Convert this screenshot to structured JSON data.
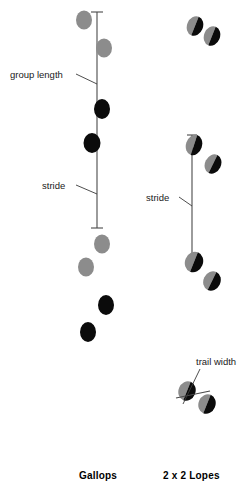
{
  "figure": {
    "width": 250,
    "height": 498,
    "background": "#ffffff"
  },
  "colors": {
    "gray_pad": "#8c8c8c",
    "black_pad": "#0b0b0b",
    "line": "#4a4a4a",
    "leader": "#3a3a3a",
    "label_text": "#1a1a1a",
    "caption_text": "#000000",
    "background": "#ffffff"
  },
  "annotations": [
    {
      "id": "group-length",
      "label": "group length",
      "text_x": 10,
      "text_y": 78,
      "leader": "M76,74 L97,84"
    },
    {
      "id": "stride-left",
      "label": "stride",
      "text_x": 42,
      "text_y": 189,
      "leader": "M76,185 L97,194"
    },
    {
      "id": "stride-right",
      "label": "stride",
      "text_x": 146,
      "text_y": 201,
      "leader": "M179,197 L192,206"
    },
    {
      "id": "trail-width",
      "label": "trail width",
      "text_x": 196,
      "text_y": 365,
      "leader": "M200,369 L183,404"
    }
  ],
  "measures": {
    "left_vertical": {
      "x": 97,
      "y_top": 12,
      "y_bottom": 228,
      "tick_half_width": 6
    },
    "right_vertical": {
      "x": 192,
      "y_top": 135,
      "y_bottom": 254,
      "tick_half_width": 5
    },
    "trail_width_bar": {
      "x1": 176,
      "y1": 398,
      "x2": 210,
      "y2": 391
    }
  },
  "panels": [
    {
      "id": "gallops",
      "caption": "Gallops",
      "caption_x": 79,
      "caption_y": 479,
      "tracks": [
        {
          "cx": 84,
          "cy": 20,
          "rx": 8,
          "ry": 9.5,
          "rotate": 0,
          "fill": "gray"
        },
        {
          "cx": 104,
          "cy": 48,
          "rx": 8,
          "ry": 9.5,
          "rotate": 0,
          "fill": "gray"
        },
        {
          "cx": 102,
          "cy": 109,
          "rx": 8,
          "ry": 10,
          "rotate": 0,
          "fill": "black"
        },
        {
          "cx": 92,
          "cy": 143,
          "rx": 8.5,
          "ry": 10,
          "rotate": 0,
          "fill": "black"
        },
        {
          "cx": 102,
          "cy": 244,
          "rx": 8,
          "ry": 9.5,
          "rotate": 0,
          "fill": "gray"
        },
        {
          "cx": 86,
          "cy": 267,
          "rx": 8,
          "ry": 9.5,
          "rotate": 0,
          "fill": "gray"
        },
        {
          "cx": 106,
          "cy": 305,
          "rx": 8,
          "ry": 10,
          "rotate": 0,
          "fill": "black"
        },
        {
          "cx": 88,
          "cy": 332,
          "rx": 8,
          "ry": 10,
          "rotate": 0,
          "fill": "black"
        }
      ]
    },
    {
      "id": "two-by-two-lopes",
      "caption": "2 x 2 Lopes",
      "caption_x": 163,
      "caption_y": 479,
      "tracks": [
        {
          "cx": 195,
          "cy": 26,
          "rx": 8,
          "ry": 10,
          "rotate": 22,
          "fill": "split"
        },
        {
          "cx": 212,
          "cy": 36,
          "rx": 8,
          "ry": 10,
          "rotate": 22,
          "fill": "split"
        },
        {
          "cx": 194,
          "cy": 145,
          "rx": 8,
          "ry": 10.5,
          "rotate": 18,
          "fill": "split"
        },
        {
          "cx": 213,
          "cy": 164,
          "rx": 8,
          "ry": 10,
          "rotate": 26,
          "fill": "split"
        },
        {
          "cx": 194,
          "cy": 262,
          "rx": 9,
          "ry": 10.5,
          "rotate": 22,
          "fill": "split"
        },
        {
          "cx": 212,
          "cy": 281,
          "rx": 8.5,
          "ry": 10,
          "rotate": 26,
          "fill": "split"
        },
        {
          "cx": 187,
          "cy": 391,
          "rx": 8.5,
          "ry": 10,
          "rotate": 22,
          "fill": "split"
        },
        {
          "cx": 207,
          "cy": 404,
          "rx": 8.5,
          "ry": 10,
          "rotate": 22,
          "fill": "split"
        }
      ]
    }
  ]
}
